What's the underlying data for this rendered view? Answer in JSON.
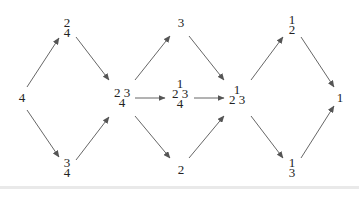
{
  "diagram": {
    "type": "directed-graph",
    "edge_color": "#555555",
    "text_color": "#222222",
    "nodes": [
      {
        "id": "n0",
        "rows": [
          "4"
        ],
        "x": 22,
        "y": 98
      },
      {
        "id": "n1",
        "rows": [
          "2",
          "4"
        ],
        "x": 67,
        "y": 28
      },
      {
        "id": "n2",
        "rows": [
          "3",
          "4"
        ],
        "x": 67,
        "y": 168
      },
      {
        "id": "n3",
        "rows": [
          "2 3",
          "4"
        ],
        "x": 122,
        "y": 98
      },
      {
        "id": "n4",
        "rows": [
          "3"
        ],
        "x": 181,
        "y": 23
      },
      {
        "id": "n5",
        "rows": [
          "1",
          "2 3",
          "4"
        ],
        "x": 180,
        "y": 94
      },
      {
        "id": "n6",
        "rows": [
          "2"
        ],
        "x": 181,
        "y": 170
      },
      {
        "id": "n7",
        "rows": [
          "1",
          "2 3"
        ],
        "x": 237,
        "y": 95
      },
      {
        "id": "n8",
        "rows": [
          "1",
          "2"
        ],
        "x": 292,
        "y": 25
      },
      {
        "id": "n9",
        "rows": [
          "1",
          "3"
        ],
        "x": 292,
        "y": 168
      },
      {
        "id": "n10",
        "rows": [
          "1"
        ],
        "x": 340,
        "y": 98
      }
    ],
    "edges": [
      {
        "from": "n0",
        "to": "n1",
        "x1": 27,
        "y1": 87,
        "x2": 59,
        "y2": 38
      },
      {
        "from": "n0",
        "to": "n2",
        "x1": 27,
        "y1": 110,
        "x2": 59,
        "y2": 157
      },
      {
        "from": "n1",
        "to": "n3",
        "x1": 76,
        "y1": 37,
        "x2": 109,
        "y2": 80
      },
      {
        "from": "n2",
        "to": "n3",
        "x1": 76,
        "y1": 160,
        "x2": 109,
        "y2": 117
      },
      {
        "from": "n3",
        "to": "n4",
        "x1": 135,
        "y1": 80,
        "x2": 170,
        "y2": 36
      },
      {
        "from": "n3",
        "to": "n5",
        "x1": 135,
        "y1": 98,
        "x2": 165,
        "y2": 98
      },
      {
        "from": "n3",
        "to": "n6",
        "x1": 135,
        "y1": 116,
        "x2": 170,
        "y2": 158
      },
      {
        "from": "n4",
        "to": "n7",
        "x1": 189,
        "y1": 36,
        "x2": 224,
        "y2": 80
      },
      {
        "from": "n5",
        "to": "n7",
        "x1": 194,
        "y1": 98,
        "x2": 224,
        "y2": 98
      },
      {
        "from": "n6",
        "to": "n7",
        "x1": 189,
        "y1": 158,
        "x2": 224,
        "y2": 116
      },
      {
        "from": "n7",
        "to": "n8",
        "x1": 251,
        "y1": 80,
        "x2": 283,
        "y2": 37
      },
      {
        "from": "n7",
        "to": "n9",
        "x1": 251,
        "y1": 116,
        "x2": 283,
        "y2": 158
      },
      {
        "from": "n8",
        "to": "n10",
        "x1": 301,
        "y1": 37,
        "x2": 334,
        "y2": 87
      },
      {
        "from": "n9",
        "to": "n10",
        "x1": 301,
        "y1": 158,
        "x2": 334,
        "y2": 106
      }
    ]
  }
}
